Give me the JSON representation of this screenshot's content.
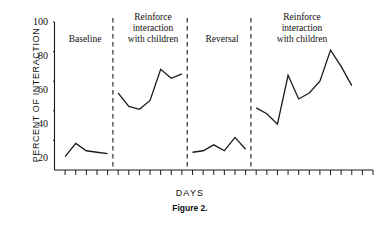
{
  "caption": "Figure 2.",
  "chart_data": {
    "type": "line",
    "title": "",
    "xlabel": "DAYS",
    "ylabel": "PERCENT OF INTERACTION",
    "ylim": [
      0,
      100
    ],
    "yticks": [
      20,
      40,
      60,
      80,
      100
    ],
    "ytick_labels": [
      "20",
      "40",
      "60",
      "80",
      "100"
    ],
    "xlim": [
      0,
      30
    ],
    "xticks_count": 30,
    "xtick_labels_shown": false,
    "grid": false,
    "legend": false,
    "phase_design": "ABAB reversal",
    "phases": [
      {
        "name": "Baseline",
        "label": "Baseline",
        "x_start": 1,
        "x_end": 5,
        "x": [
          1,
          2,
          3,
          4,
          5
        ],
        "values": [
          9,
          18,
          13,
          12,
          11
        ]
      },
      {
        "name": "Reinforce interaction with children",
        "label": "Reinforce\ninteraction\nwith children",
        "x_start": 6,
        "x_end": 12,
        "x": [
          6,
          7,
          8,
          9,
          10,
          11,
          12
        ],
        "values": [
          52,
          43,
          41,
          47,
          68,
          62,
          65
        ]
      },
      {
        "name": "Reversal",
        "label": "Reversal",
        "x_start": 13,
        "x_end": 18,
        "x": [
          13,
          14,
          15,
          16,
          17,
          18
        ],
        "values": [
          12,
          13,
          17,
          13,
          22,
          14
        ]
      },
      {
        "name": "Reinforce interaction with children",
        "label": "Reinforce\ninteraction\nwith children",
        "x_start": 19,
        "x_end": 28,
        "x": [
          19,
          20,
          21,
          22,
          23,
          24,
          25,
          26,
          27,
          28
        ],
        "values": [
          42,
          38,
          31,
          64,
          48,
          52,
          60,
          81,
          70,
          57
        ]
      }
    ],
    "phase_dividers_x": [
      5.5,
      12.5,
      18.5
    ],
    "line_color": "#1a1a1a",
    "divider_color": "#2b2b2b",
    "axis_color": "#1a1a1a"
  }
}
